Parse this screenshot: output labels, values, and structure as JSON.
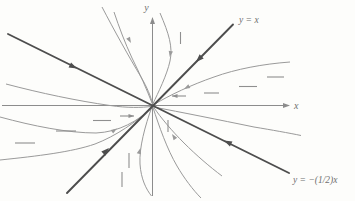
{
  "figure": {
    "background": "#fdfdfb",
    "colors": {
      "axis": "#8c8c8c",
      "bold_line": "#4d4d4d",
      "trajectory": "#9a9a9a",
      "dash": "#8f8f8f",
      "label": "#6f6f6f"
    },
    "axes": {
      "x_label": "x",
      "y_label": "y",
      "x_axis": {
        "x1": 2,
        "y1": 105.5,
        "x2": 288,
        "y2": 105.5
      },
      "y_axis": {
        "x1": 152.5,
        "y1": 196,
        "x2": 152.5,
        "y2": 18
      },
      "x_label_pos": {
        "x": 294,
        "y": 108.5
      },
      "y_label_pos": {
        "x": 146.5,
        "y": 11
      }
    },
    "eigenlines": [
      {
        "name": "y-equals-x",
        "label": "y = x",
        "x1": 67,
        "y1": 193,
        "x2": 233,
        "y2": 24.5,
        "label_pos": {
          "x": 239,
          "y": 23
        }
      },
      {
        "name": "y-equals-minus-half-x",
        "label": "y = −(1/2)x",
        "x1": 8,
        "y1": 34,
        "x2": 289,
        "y2": 173,
        "label_pos": {
          "x": 293,
          "y": 183
        }
      }
    ],
    "trajectories": [
      {
        "name": "upper-right-hug-y-axis",
        "path": "M 160,13 C 169,34 173,47 170,61 C 167,75 158,93 152.8,104"
      },
      {
        "name": "upper-left-swoop",
        "path": "M 102,7 C 114,30 129,57 141,77 C 147,87 151,97 152.4,103.5"
      },
      {
        "name": "upper-left-steep",
        "path": "M 152.2,103.5 C 147,90 140,74 132,58 C 125,43 119,27 114,12"
      },
      {
        "name": "right-upper-flattening",
        "path": "M 290,62 C 263,64 236,69 214,77 C 191,85 170,95 154,104.5"
      },
      {
        "name": "right-below-axis",
        "path": "M 153.5,107 C 180,112 220,120 254,127 C 272,130 289,133 301,135.5"
      },
      {
        "name": "left-above-axis",
        "path": "M 6,84 C 40,93 78,101 110,105.5 C 127,108 142,107.8 152,106.3"
      },
      {
        "name": "left-lower-bulge",
        "path": "M 0,117 C 33,126 68,133 96,133 C 119,132 138,121 152,107.5"
      },
      {
        "name": "left-lower-flat",
        "path": "M 0,160 C 38,156 72,152 95,144 C 116,136 136,122 151.8,107.8"
      },
      {
        "name": "lower-right-mid",
        "path": "M 153.5,107 C 161,118 172,131 184,143 C 196,155 210,167 222,176"
      },
      {
        "name": "lower-right-steep",
        "path": "M 153,107.5 C 159,126 167,149 177,166 C 184,178 193,190 201,198"
      },
      {
        "name": "lower-left-hug-y-axis",
        "path": "M 152,106.5 C 145,126 139,148 140,164 C 141,179 146,189 151.5,196"
      }
    ],
    "slope_dashes": {
      "horizontal": [
        {
          "x1": 267,
          "y": 77,
          "x2": 284
        },
        {
          "x1": 239,
          "y": 86.5,
          "x2": 257
        },
        {
          "x1": 204,
          "y": 93,
          "x2": 219
        },
        {
          "x1": 93,
          "y": 120.5,
          "x2": 111
        },
        {
          "x1": 56,
          "y": 131,
          "x2": 76
        },
        {
          "x1": 15,
          "y": 143,
          "x2": 35
        }
      ],
      "vertical": [
        {
          "x": 180.5,
          "y1": 32,
          "y2": 44
        },
        {
          "x": 168,
          "y1": 120,
          "y2": 132
        },
        {
          "x": 129,
          "y1": 153,
          "y2": 168
        },
        {
          "x": 122,
          "y1": 172,
          "y2": 187
        }
      ]
    },
    "field_arrows": [
      {
        "name": "above-axis-left-pointing",
        "x1": 186,
        "y1": 96,
        "x2": 172,
        "y2": 96,
        "angle": 180
      },
      {
        "name": "below-axis-right-pointing",
        "x1": 120,
        "y1": 116,
        "x2": 134,
        "y2": 116,
        "angle": 0
      }
    ],
    "arrowheads": [
      {
        "on": "x-axis",
        "x": 290,
        "y": 105.5,
        "angle": 0,
        "size": 7,
        "kind": "axis"
      },
      {
        "on": "y-axis",
        "x": 152.5,
        "y": 17,
        "angle": -90,
        "size": 7,
        "kind": "axis"
      },
      {
        "on": "y-equals-x-upper",
        "x": 196,
        "y": 62,
        "angle": 135,
        "size": 8,
        "kind": "bold"
      },
      {
        "on": "y-equals-x-lower",
        "x": 109,
        "y": 148,
        "angle": -45,
        "size": 8,
        "kind": "bold"
      },
      {
        "on": "y-equals-minus-half-x-left",
        "x": 77,
        "y": 68.5,
        "angle": 26,
        "size": 8,
        "kind": "bold"
      },
      {
        "on": "y-equals-minus-half-x-right",
        "x": 224,
        "y": 140.5,
        "angle": 206,
        "size": 8,
        "kind": "bold"
      },
      {
        "on": "upper-right-hug-y-axis",
        "x": 169.8,
        "y": 57,
        "angle": 100,
        "size": 6,
        "kind": "thin"
      },
      {
        "on": "upper-left-swoop",
        "x": 131,
        "y": 43,
        "angle": 61,
        "size": 6,
        "kind": "thin"
      },
      {
        "on": "right-upper-flattening",
        "x": 184,
        "y": 89,
        "angle": 152,
        "size": 6,
        "kind": "thin"
      },
      {
        "on": "left-lower-bulge",
        "x": 117,
        "y": 128.5,
        "angle": -33,
        "size": 6,
        "kind": "thin"
      },
      {
        "on": "lower-right-mid",
        "x": 172,
        "y": 134,
        "angle": -124,
        "size": 6,
        "kind": "thin"
      },
      {
        "on": "lower-left-hug-y-axis",
        "x": 140.5,
        "y": 148,
        "angle": -74,
        "size": 6,
        "kind": "thin"
      }
    ]
  }
}
